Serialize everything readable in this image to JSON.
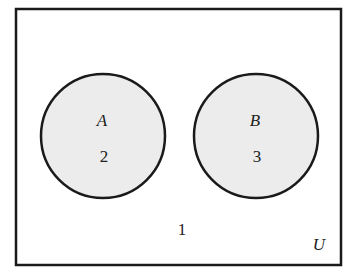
{
  "diagram": {
    "type": "venn",
    "universe": {
      "label": "U",
      "outside_count": "1"
    },
    "sets": [
      {
        "label": "A",
        "count": "2"
      },
      {
        "label": "B",
        "count": "3"
      }
    ],
    "colors": {
      "circle_fill": "#ececec",
      "stroke": "#1a1a1a",
      "background": "#ffffff"
    }
  }
}
